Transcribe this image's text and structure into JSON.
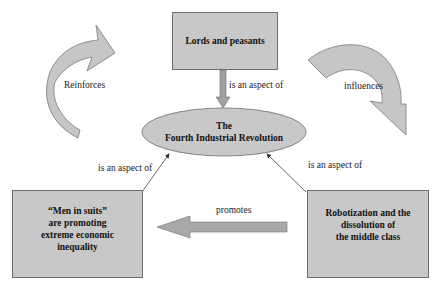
{
  "diagram": {
    "nodes": {
      "top": {
        "label": "Lords and peasants"
      },
      "center": {
        "line1": "The",
        "line2": "Fourth Industrial Revolution"
      },
      "left": {
        "line1": "“Men in suits”",
        "line2": "are promoting",
        "line3": "extreme economic",
        "line4": "inequality"
      },
      "right": {
        "line1": "Robotization and the",
        "line2": "dissolution of",
        "line3": "the middle class"
      }
    },
    "edges": {
      "top_to_center": {
        "label": "is an aspect of"
      },
      "left_to_center": {
        "label": "is an aspect of"
      },
      "right_to_center": {
        "label": "is an aspect of"
      },
      "right_to_left": {
        "label": "promotes"
      },
      "reinforces": {
        "label": "Reinforces"
      },
      "influences": {
        "label": "influences"
      }
    },
    "colors": {
      "fill": "#c8c8c8",
      "stroke": "#6e6e6e",
      "arrow_fill": "#a8a8a8",
      "background": "#ffffff"
    }
  }
}
